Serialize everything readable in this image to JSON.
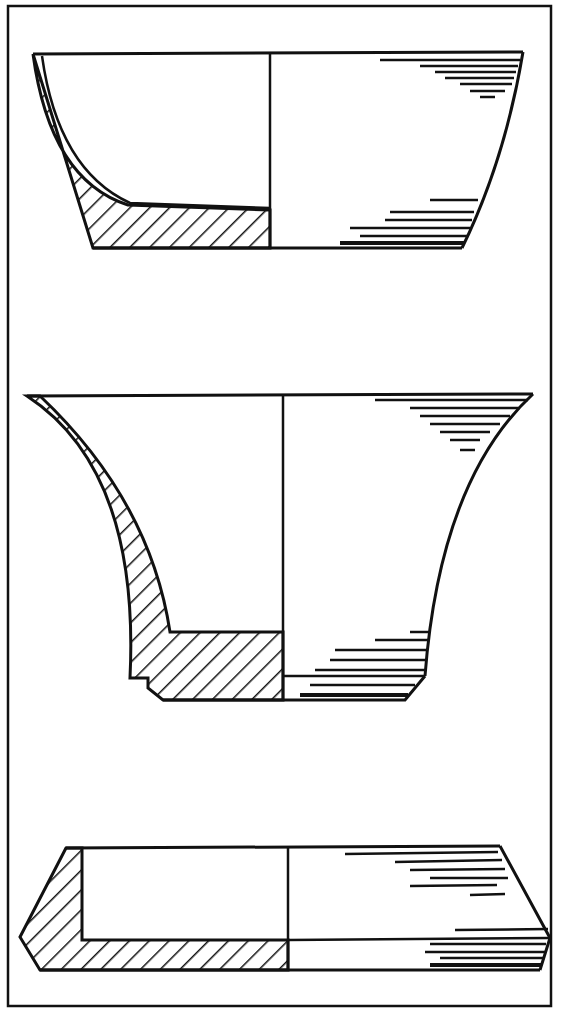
{
  "figure": {
    "type": "archaeological pottery profile drawings",
    "frame": {
      "x": 7,
      "y": 5,
      "width": 545,
      "height": 1002
    },
    "colors": {
      "ink": "#111111",
      "paper": "#ffffff"
    },
    "vessels": [
      {
        "name": "deep-bowl",
        "description": "Bowl with curved left profile, sectioned (hatched) left half, shaded exterior right half",
        "rim_y": 53,
        "base_y": 248
      },
      {
        "name": "flared-cup",
        "description": "Flared vessel with stepped foot ring, hatched section left, shaded right",
        "rim_y": 395,
        "base_y": 700
      },
      {
        "name": "shallow-dish",
        "description": "Shallow carinated dish with angular profile",
        "rim_y": 847,
        "base_y": 970
      }
    ]
  }
}
